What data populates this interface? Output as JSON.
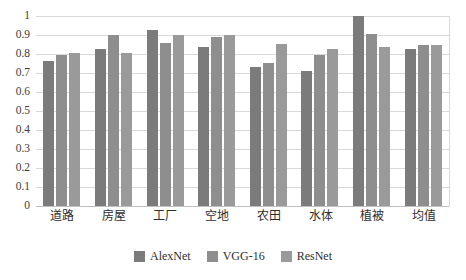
{
  "chart_data": {
    "type": "bar",
    "title": "",
    "xlabel": "",
    "ylabel": "",
    "ylim": [
      0,
      1
    ],
    "ytick_labels": [
      "1",
      "0.9",
      "0.8",
      "0.7",
      "0.6",
      "0.5",
      "0.4",
      "0.3",
      "0.2",
      "0.1",
      "0"
    ],
    "ytick_values": [
      1,
      0.9,
      0.8,
      0.7,
      0.6,
      0.5,
      0.4,
      0.3,
      0.2,
      0.1,
      0
    ],
    "grid": true,
    "legend_position": "bottom-center",
    "categories": [
      "道路",
      "房屋",
      "工厂",
      "空地",
      "农田",
      "水体",
      "植被",
      "均值"
    ],
    "series": [
      {
        "name": "AlexNet",
        "color": "#7b7b7b",
        "values": [
          0.765,
          0.825,
          0.925,
          0.835,
          0.73,
          0.71,
          1.0,
          0.825
        ]
      },
      {
        "name": "VGG-16",
        "color": "#8e8e8e",
        "values": [
          0.795,
          0.9,
          0.86,
          0.89,
          0.755,
          0.795,
          0.905,
          0.85
        ]
      },
      {
        "name": "ResNet",
        "color": "#9a9a9a",
        "values": [
          0.805,
          0.805,
          0.9,
          0.9,
          0.855,
          0.825,
          0.835,
          0.85
        ]
      }
    ]
  }
}
